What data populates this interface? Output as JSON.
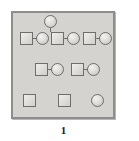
{
  "figure": {
    "caption": "1",
    "panel": {
      "background_color": "#d4d3d0",
      "border_color": "#8e8d8b"
    },
    "shape_colors": {
      "square_fill": "#e2e1de",
      "circle_fill": "#e0dfdc",
      "outline": "#6f6e6c"
    },
    "legend": {
      "square_meaning": "male",
      "circle_meaning": "female"
    },
    "rows": [
      {
        "name": "generation-0",
        "nodes": [
          {
            "id": "g0-c1",
            "shape": "circle",
            "label": ""
          }
        ]
      },
      {
        "name": "generation-1",
        "nodes": [
          {
            "id": "g1-s1",
            "shape": "square",
            "label": ""
          },
          {
            "id": "g1-c1",
            "shape": "circle",
            "label": ""
          },
          {
            "id": "g1-s2",
            "shape": "square",
            "label": ""
          },
          {
            "id": "g1-c2",
            "shape": "circle",
            "label": ""
          },
          {
            "id": "g1-s3",
            "shape": "square",
            "label": ""
          },
          {
            "id": "g1-c3",
            "shape": "circle",
            "label": ""
          }
        ]
      },
      {
        "name": "generation-2",
        "nodes": [
          {
            "id": "g2-s1",
            "shape": "square",
            "label": ""
          },
          {
            "id": "g2-c1",
            "shape": "circle",
            "label": ""
          },
          {
            "id": "g2-s2",
            "shape": "square",
            "label": ""
          },
          {
            "id": "g2-c2",
            "shape": "circle",
            "label": ""
          }
        ]
      },
      {
        "name": "generation-3",
        "nodes": [
          {
            "id": "g3-s1",
            "shape": "square",
            "label": ""
          },
          {
            "id": "g3-s2",
            "shape": "square",
            "label": ""
          },
          {
            "id": "g3-c1",
            "shape": "circle",
            "label": ""
          }
        ]
      }
    ]
  }
}
